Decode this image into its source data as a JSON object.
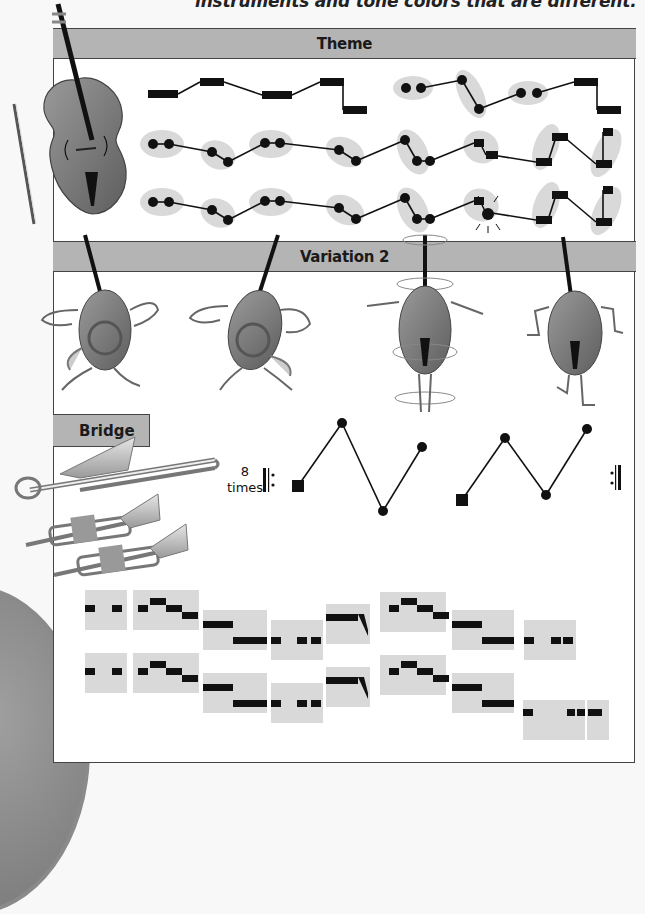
{
  "caption": "instruments and tone colors that are different.",
  "sections": {
    "theme": "Theme",
    "variation": "Variation 2",
    "bridge": "Bridge"
  },
  "repeat": {
    "count": "8",
    "unit": "times",
    "start_sign": "repeat-start",
    "end_sign": "repeat-end"
  },
  "colors": {
    "band": "#b4b4b4",
    "group_shade": "#d9d9d9",
    "note": "#111111",
    "frame": "#444444"
  },
  "illustrations": [
    {
      "name": "cello-with-bow",
      "area": "theme-left"
    },
    {
      "name": "cello-with-french-horn-dancing-1",
      "area": "variation-2"
    },
    {
      "name": "cello-with-french-horn-dancing-2",
      "area": "variation-2"
    },
    {
      "name": "spinning-cello",
      "area": "variation-2"
    },
    {
      "name": "walking-cello",
      "area": "variation-2"
    },
    {
      "name": "trombone",
      "area": "bridge"
    },
    {
      "name": "trumpet-1",
      "area": "bridge"
    },
    {
      "name": "trumpet-2",
      "area": "bridge"
    },
    {
      "name": "timpani-drum",
      "area": "left-edge"
    }
  ],
  "theme_row1": {
    "bars": [
      [
        148,
        90,
        30,
        8
      ],
      [
        200,
        78,
        24,
        8
      ],
      [
        262,
        91,
        30,
        8
      ],
      [
        320,
        78,
        24,
        8
      ],
      [
        343,
        106,
        24,
        8
      ],
      [
        574,
        78,
        24,
        8
      ],
      [
        597,
        106,
        24,
        8
      ]
    ],
    "lines": [
      [
        178,
        94,
        200,
        82
      ],
      [
        224,
        82,
        262,
        95
      ],
      [
        292,
        95,
        320,
        82
      ],
      [
        343,
        82,
        343,
        110
      ],
      [
        597,
        82,
        597,
        110
      ]
    ],
    "dots": [
      [
        406,
        88
      ],
      [
        421,
        88
      ],
      [
        462,
        80
      ],
      [
        479,
        109
      ],
      [
        521,
        93
      ],
      [
        537,
        93
      ]
    ],
    "groups": [
      [
        413,
        88,
        20,
        12,
        0
      ],
      [
        471,
        94,
        12,
        26,
        -25
      ],
      [
        528,
        93,
        20,
        12,
        0
      ]
    ],
    "dot_lines": [
      [
        421,
        88,
        462,
        80
      ],
      [
        462,
        80,
        479,
        109
      ],
      [
        479,
        109,
        521,
        93
      ],
      [
        537,
        93,
        574,
        82
      ]
    ]
  },
  "theme_rows_repeated": [
    {
      "y": 0,
      "label": "theme-row-2"
    },
    {
      "y": 58,
      "label": "theme-row-3",
      "accent_note": true
    }
  ],
  "bridge_contour": {
    "left": {
      "start": [
        298,
        486
      ],
      "peak": [
        342,
        423
      ],
      "low": [
        383,
        511
      ],
      "end": [
        422,
        447
      ]
    },
    "right": {
      "start": [
        462,
        500
      ],
      "peak": [
        505,
        438
      ],
      "low": [
        546,
        495
      ],
      "end": [
        587,
        429
      ]
    }
  },
  "bottom_rows": [
    {
      "y": 590
    },
    {
      "y": 653
    }
  ]
}
